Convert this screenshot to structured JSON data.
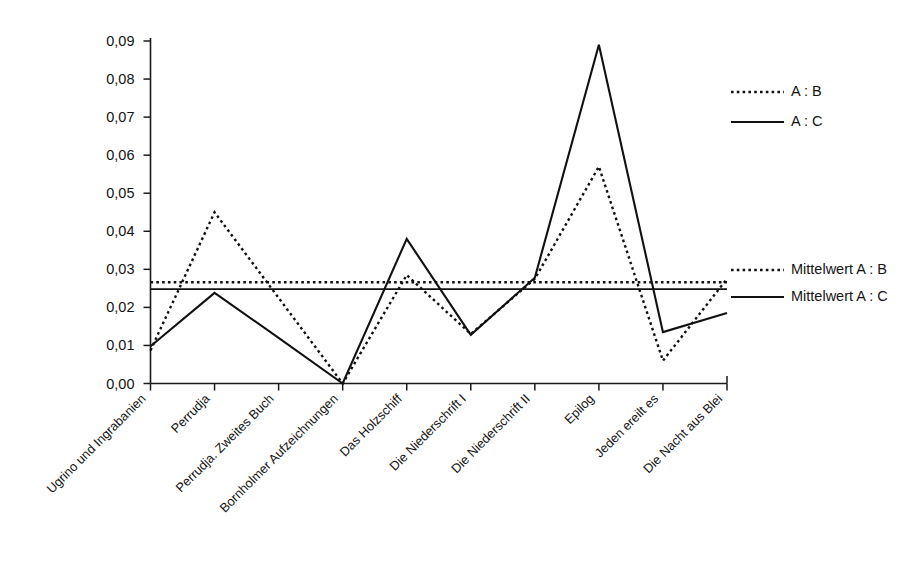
{
  "chart_data": {
    "type": "line",
    "title": "",
    "xlabel": "",
    "ylabel": "",
    "ylim": [
      0,
      0.09
    ],
    "grid": false,
    "legend_position": "right",
    "ytick_labels": [
      "0,09",
      "0,08",
      "0,07",
      "0,06",
      "0,05",
      "0,04",
      "0,03",
      "0,02",
      "0,01",
      "0,00"
    ],
    "ytick_values": [
      0.09,
      0.08,
      0.07,
      0.06,
      0.05,
      0.04,
      0.03,
      0.02,
      0.01,
      0.0
    ],
    "categories": [
      "Ugrino und Ingrabanien",
      "Perrudja",
      "Perrudja. Zweites Buch",
      "Bornholmer Aufzeichnungen",
      "Das Holzschiff",
      "Die Niederschrift I",
      "Die Niederschrift II",
      "Epilog",
      "Jeden ereilt es",
      "Die Nacht aus Blei"
    ],
    "series": [
      {
        "name": "A : B",
        "style": "dotted",
        "values": [
          0.0087,
          0.045,
          0.0225,
          0.0,
          0.0285,
          0.013,
          0.0275,
          0.057,
          0.006,
          0.0275
        ]
      },
      {
        "name": "A : C",
        "style": "solid",
        "values": [
          0.0098,
          0.0238,
          0.012,
          0.0,
          0.038,
          0.0128,
          0.0278,
          0.089,
          0.0135,
          0.0185
        ]
      }
    ],
    "reference_lines": [
      {
        "name": "Mittelwert A : B",
        "style": "dotted",
        "value": 0.0266
      },
      {
        "name": "Mittelwert A : C",
        "style": "solid",
        "value": 0.0248
      }
    ]
  },
  "legend": {
    "series_entries": [
      {
        "label": "A : B",
        "style": "dotted"
      },
      {
        "label": "A : C",
        "style": "solid"
      }
    ],
    "mean_entries": [
      {
        "label": "Mittelwert A : B",
        "style": "dotted"
      },
      {
        "label": "Mittelwert A : C",
        "style": "solid"
      }
    ]
  },
  "colors": {
    "line": "#111111",
    "axis": "#1a1a1a",
    "background": "#ffffff"
  }
}
